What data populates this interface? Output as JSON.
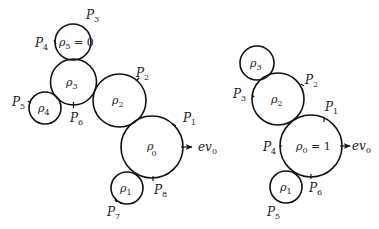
{
  "diagrams": [
    {
      "name": "left",
      "circles": [
        {
          "id": "rho5",
          "label": "ρ",
          "sub": "5",
          "suffix": " = 0",
          "cx": 73,
          "cy": 42,
          "r": 18
        },
        {
          "id": "rho3",
          "label": "ρ",
          "sub": "3",
          "suffix": "",
          "cx": 73.5,
          "cy": 82,
          "r": 23
        },
        {
          "id": "rho4",
          "label": "ρ",
          "sub": "4",
          "suffix": "",
          "cx": 45,
          "cy": 108,
          "r": 16
        },
        {
          "id": "rho2",
          "label": "ρ",
          "sub": "2",
          "suffix": "",
          "cx": 119.5,
          "cy": 100.5,
          "r": 26.5
        },
        {
          "id": "rho0",
          "label": "ρ",
          "sub": "0",
          "suffix": "",
          "cx": 152,
          "cy": 147,
          "r": 31
        },
        {
          "id": "rho1",
          "label": "ρ",
          "sub": "1",
          "suffix": "",
          "cx": 127,
          "cy": 188,
          "r": 16
        }
      ],
      "points": [
        {
          "label": "P",
          "sub": "1"
        },
        {
          "label": "P",
          "sub": "2"
        },
        {
          "label": "P",
          "sub": "3"
        },
        {
          "label": "P",
          "sub": "4"
        },
        {
          "label": "P",
          "sub": "5"
        },
        {
          "label": "P",
          "sub": "6"
        },
        {
          "label": "P",
          "sub": "7"
        },
        {
          "label": "P",
          "sub": "8"
        }
      ],
      "arrow_label": {
        "text": "ev",
        "sub": "0"
      }
    },
    {
      "name": "right",
      "circles": [
        {
          "id": "rho3",
          "label": "ρ",
          "sub": "3",
          "suffix": "",
          "cx": 257,
          "cy": 63,
          "r": 17
        },
        {
          "id": "rho2",
          "label": "ρ",
          "sub": "2",
          "suffix": "",
          "cx": 278,
          "cy": 99,
          "r": 26
        },
        {
          "id": "rho0",
          "label": "ρ",
          "sub": "0",
          "suffix": " = 1",
          "cx": 311,
          "cy": 146,
          "r": 31
        },
        {
          "id": "rho1",
          "label": "ρ",
          "sub": "1",
          "suffix": "",
          "cx": 286,
          "cy": 187,
          "r": 16
        }
      ],
      "points": [
        {
          "label": "P",
          "sub": "1"
        },
        {
          "label": "P",
          "sub": "2"
        },
        {
          "label": "P",
          "sub": "3"
        },
        {
          "label": "P",
          "sub": "4"
        },
        {
          "label": "P",
          "sub": "5"
        },
        {
          "label": "P",
          "sub": "6"
        }
      ],
      "arrow_label": {
        "text": "ev",
        "sub": "0"
      }
    }
  ]
}
